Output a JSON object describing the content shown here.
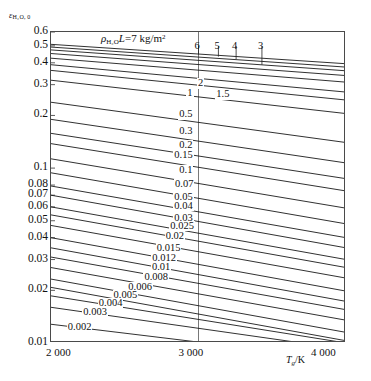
{
  "chart_data": {
    "type": "line",
    "title": "",
    "ylabel": "εH2O,0",
    "ylabel_base": "ε",
    "ylabel_sub": "H₂O, 0",
    "xlabel": "Tg/K",
    "xlabel_base": "T",
    "xlabel_sub": "g",
    "xlabel_unit": "/K",
    "xlim": [
      2000,
      4000
    ],
    "ylim": [
      0.01,
      0.6
    ],
    "yscale": "log",
    "xscale": "linear",
    "grid": false,
    "legend_position": "inline-curve-labels",
    "annotation": {
      "text": "ρH2O L = 7 kg/m²",
      "base": "ρ",
      "sub": "H₂O",
      "rest": "L",
      "equals": "=7 kg/m",
      "sup": "2"
    },
    "xticks": [
      {
        "value": 2000,
        "label": "2 000"
      },
      {
        "value": 3000,
        "label": "3 000"
      },
      {
        "value": 4000,
        "label": "4 000"
      }
    ],
    "yticks": [
      {
        "value": 0.6,
        "label": "0.6"
      },
      {
        "value": 0.5,
        "label": "0.5"
      },
      {
        "value": 0.4,
        "label": "0.4"
      },
      {
        "value": 0.3,
        "label": "0.3"
      },
      {
        "value": 0.2,
        "label": "0.2"
      },
      {
        "value": 0.1,
        "label": "0.1"
      },
      {
        "value": 0.08,
        "label": "0.08"
      },
      {
        "value": 0.07,
        "label": "0.07"
      },
      {
        "value": 0.06,
        "label": "0.06"
      },
      {
        "value": 0.05,
        "label": "0.05"
      },
      {
        "value": 0.04,
        "label": "0.04"
      },
      {
        "value": 0.03,
        "label": "0.03"
      },
      {
        "value": 0.02,
        "label": "0.02"
      },
      {
        "value": 0.01,
        "label": "0.01"
      }
    ],
    "vertical_reference_line": 3000,
    "curve_parameter_name": "pH2O L (kg/m2)",
    "series": [
      {
        "name": "7",
        "label": "7",
        "label_style": "top",
        "x": [
          2000,
          4000
        ],
        "y": [
          0.51,
          0.395
        ]
      },
      {
        "name": "6",
        "label": "6",
        "label_style": "top",
        "x": [
          2000,
          4000
        ],
        "y": [
          0.492,
          0.378
        ]
      },
      {
        "name": "5",
        "label": "5",
        "label_style": "top",
        "x": [
          2000,
          4000
        ],
        "y": [
          0.474,
          0.36
        ]
      },
      {
        "name": "4",
        "label": "4",
        "label_style": "top",
        "x": [
          2000,
          4000
        ],
        "y": [
          0.452,
          0.338
        ]
      },
      {
        "name": "3",
        "label": "3",
        "label_style": "top",
        "x": [
          2000,
          4000
        ],
        "y": [
          0.425,
          0.31
        ]
      },
      {
        "name": "2",
        "label": "2",
        "label_style": "inline",
        "x": [
          2000,
          4000
        ],
        "y": [
          0.39,
          0.272
        ]
      },
      {
        "name": "1.5",
        "label": "1.5",
        "label_style": "inline",
        "x": [
          2000,
          4000
        ],
        "y": [
          0.362,
          0.245
        ]
      },
      {
        "name": "1",
        "label": "1",
        "label_style": "inline",
        "x": [
          2000,
          4000
        ],
        "y": [
          0.318,
          0.205
        ]
      },
      {
        "name": "0.5",
        "label": "0.5",
        "label_style": "inline",
        "x": [
          2000,
          4000
        ],
        "y": [
          0.238,
          0.14
        ]
      },
      {
        "name": "0.3",
        "label": "0.3",
        "label_style": "inline",
        "x": [
          2000,
          4000
        ],
        "y": [
          0.19,
          0.107
        ]
      },
      {
        "name": "0.2",
        "label": "0.2",
        "label_style": "inline",
        "x": [
          2000,
          4000
        ],
        "y": [
          0.158,
          0.087
        ]
      },
      {
        "name": "0.15",
        "label": "0.15",
        "label_style": "inline",
        "x": [
          2000,
          4000
        ],
        "y": [
          0.138,
          0.074
        ]
      },
      {
        "name": "0.1",
        "label": "0.1",
        "label_style": "inline",
        "x": [
          2000,
          4000
        ],
        "y": [
          0.113,
          0.059
        ]
      },
      {
        "name": "0.07",
        "label": "0.07",
        "label_style": "inline",
        "x": [
          2000,
          4000
        ],
        "y": [
          0.094,
          0.048
        ]
      },
      {
        "name": "0.05",
        "label": "0.05",
        "label_style": "inline",
        "x": [
          2000,
          4000
        ],
        "y": [
          0.079,
          0.04
        ]
      },
      {
        "name": "0.04",
        "label": "0.04",
        "label_style": "inline",
        "x": [
          2000,
          4000
        ],
        "y": [
          0.07,
          0.035
        ]
      },
      {
        "name": "0.03",
        "label": "0.03",
        "label_style": "inline",
        "x": [
          2000,
          4000
        ],
        "y": [
          0.06,
          0.03
        ]
      },
      {
        "name": "0.025",
        "label": "0.025",
        "label_style": "inline",
        "x": [
          2000,
          4000
        ],
        "y": [
          0.054,
          0.027
        ]
      },
      {
        "name": "0.02",
        "label": "0.02",
        "label_style": "inline",
        "x": [
          2000,
          4000
        ],
        "y": [
          0.047,
          0.0235
        ]
      },
      {
        "name": "0.015",
        "label": "0.015",
        "label_style": "inline",
        "x": [
          2000,
          4000
        ],
        "y": [
          0.04,
          0.0198
        ]
      },
      {
        "name": "0.012",
        "label": "0.012",
        "label_style": "inline",
        "x": [
          2000,
          4000
        ],
        "y": [
          0.035,
          0.0173
        ]
      },
      {
        "name": "0.01",
        "label": "0.01",
        "label_style": "inline",
        "x": [
          2000,
          4000
        ],
        "y": [
          0.031,
          0.0155
        ]
      },
      {
        "name": "0.008",
        "label": "0.008",
        "label_style": "inline",
        "x": [
          2000,
          4000
        ],
        "y": [
          0.027,
          0.0135
        ]
      },
      {
        "name": "0.006",
        "label": "0.006",
        "label_style": "inline",
        "x": [
          2000,
          4000
        ],
        "y": [
          0.0232,
          0.0115
        ]
      },
      {
        "name": "0.005",
        "label": "0.005",
        "label_style": "inline",
        "x": [
          2000,
          4000
        ],
        "y": [
          0.0208,
          0.0103
        ]
      },
      {
        "name": "0.004",
        "label": "0.004",
        "label_style": "inline",
        "x": [
          2000,
          4000
        ],
        "y": [
          0.0186,
          0.01
        ]
      },
      {
        "name": "0.003",
        "label": "0.003",
        "label_style": "inline",
        "x": [
          2000,
          3700
        ],
        "y": [
          0.016,
          0.01
        ]
      },
      {
        "name": "0.002",
        "label": "0.002",
        "label_style": "inline",
        "x": [
          2000,
          3050
        ],
        "y": [
          0.0128,
          0.01
        ]
      }
    ]
  }
}
